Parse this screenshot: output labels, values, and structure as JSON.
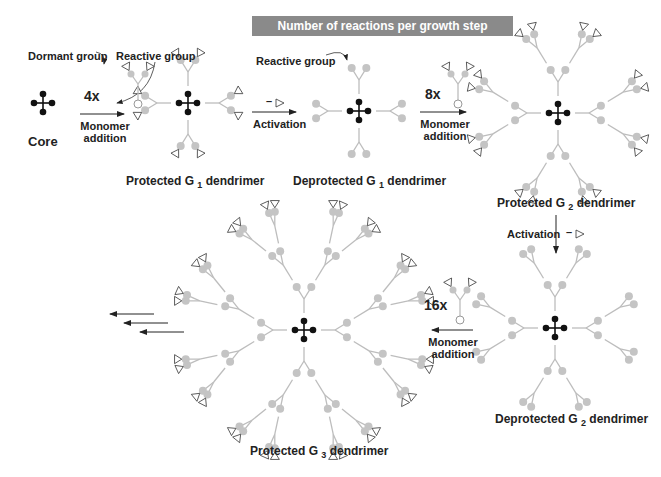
{
  "banner": {
    "text": "Number of reactions per growth step increases"
  },
  "labels": {
    "core": "Core",
    "dormant_group": "Dormant group",
    "reactive_group_1": "Reactive group",
    "reactive_group_2": "Reactive group",
    "mult_4x": "4x",
    "mult_8x": "8x",
    "mult_16x": "16x",
    "monomer_addition_1a": "Monomer",
    "monomer_addition_1b": "addition",
    "monomer_addition_2a": "Monomer",
    "monomer_addition_2b": "addition",
    "monomer_addition_3a": "Monomer",
    "monomer_addition_3b": "addition",
    "activation_1": "Activation",
    "activation_2": "Activation",
    "minus": "–",
    "protected_g1": {
      "pre": "Protected G ",
      "sub": "1",
      "post": " dendrimer"
    },
    "deprotected_g1": {
      "pre": "Deprotected G ",
      "sub": "1",
      "post": " dendrimer"
    },
    "protected_g2": {
      "pre": "Protected G ",
      "sub": "2",
      "post": " dendrimer"
    },
    "deprotected_g2": {
      "pre": "Deprotected G ",
      "sub": "2",
      "post": " dendrimer"
    },
    "protected_g3": {
      "pre": "Protected G ",
      "sub": "3",
      "post": " dendrimer"
    }
  },
  "colors": {
    "core": "#111111",
    "branch": "#bdbdbd",
    "node": "#c4c4c4",
    "cap_stroke": "#333333",
    "arrow": "#222222",
    "banner_bg": "#8a8a8a"
  },
  "dendrimers": [
    {
      "name": "core",
      "cx": 43,
      "cy": 103,
      "gen": 0,
      "protected": false,
      "scale": 1
    },
    {
      "name": "protected-g1",
      "cx": 188,
      "cy": 103,
      "gen": 1,
      "protected": true,
      "scale": 1
    },
    {
      "name": "deprotected-g1",
      "cx": 359,
      "cy": 111,
      "gen": 1,
      "protected": false,
      "scale": 1
    },
    {
      "name": "protected-g2",
      "cx": 558,
      "cy": 113,
      "gen": 2,
      "protected": true,
      "scale": 1
    },
    {
      "name": "deprotected-g2",
      "cx": 555,
      "cy": 328,
      "gen": 2,
      "protected": false,
      "scale": 1
    },
    {
      "name": "protected-g3",
      "cx": 304,
      "cy": 330,
      "gen": 3,
      "protected": true,
      "scale": 1
    }
  ],
  "monomers": [
    {
      "x": 138,
      "y": 104,
      "label": "4x"
    },
    {
      "x": 458,
      "y": 104,
      "label": "8x"
    },
    {
      "x": 460,
      "y": 320,
      "label": "16x"
    }
  ]
}
